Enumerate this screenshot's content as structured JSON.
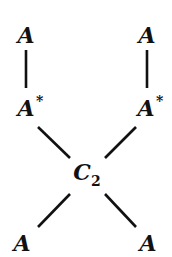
{
  "diagram": {
    "nodes": [
      {
        "id": "top_left",
        "label": "A"
      },
      {
        "id": "top_right",
        "label": "A"
      },
      {
        "id": "mid_left",
        "label": "A",
        "superscript": "*"
      },
      {
        "id": "mid_right",
        "label": "A",
        "superscript": "*"
      },
      {
        "id": "center",
        "label": "C",
        "subscript": "2"
      },
      {
        "id": "bottom_left",
        "label": "A"
      },
      {
        "id": "bottom_right",
        "label": "A"
      }
    ],
    "edges": [
      {
        "from": "top_left",
        "to": "mid_left"
      },
      {
        "from": "top_right",
        "to": "mid_right"
      },
      {
        "from": "mid_left",
        "to": "center"
      },
      {
        "from": "mid_right",
        "to": "center"
      },
      {
        "from": "center",
        "to": "bottom_left"
      },
      {
        "from": "center",
        "to": "bottom_right"
      }
    ]
  }
}
